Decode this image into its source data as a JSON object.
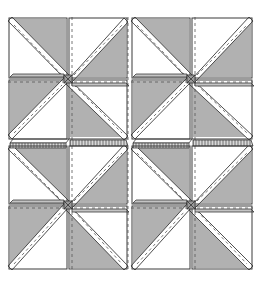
{
  "diagram": {
    "layout": {
      "rows": 2,
      "cols": 2
    },
    "colors": {
      "fabric_gray": "#b1b1b1",
      "fabric_white": "#ffffff",
      "outline": "#3a3a3a",
      "stitch": "#555555",
      "seam_band": "#9a9a9a"
    },
    "blocks": [
      {
        "id": "block-top-left",
        "center": [
          68,
          79
        ]
      },
      {
        "id": "block-top-right",
        "center": [
          191,
          79
        ]
      },
      {
        "id": "block-bottom-left",
        "center": [
          68,
          205
        ]
      },
      {
        "id": "block-bottom-right",
        "center": [
          191,
          205
        ]
      }
    ]
  }
}
